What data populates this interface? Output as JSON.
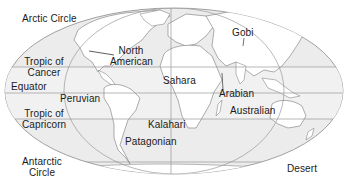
{
  "map": {
    "title": "World deserts map",
    "colors": {
      "ocean": "#ececec",
      "land": "#ffffff",
      "outline": "#8a8a8a",
      "grid": "#9a9a9a",
      "text": "#1a1a1a"
    },
    "latitude_labels": {
      "arctic_circle": "Arctic Circle",
      "tropic_cancer_1": "Tropic of",
      "tropic_cancer_2": "Cancer",
      "equator": "Equator",
      "tropic_capricorn_1": "Tropic of",
      "tropic_capricorn_2": "Capricorn",
      "antarctic_1": "Antarctic",
      "antarctic_2": "Circle"
    },
    "deserts": {
      "north_american_1": "North",
      "north_american_2": "American",
      "sahara": "Sahara",
      "gobi": "Gobi",
      "arabian": "Arabian",
      "australian": "Australian",
      "peruvian": "Peruvian",
      "kalahari": "Kalahari",
      "patagonian": "Patagonian",
      "desert_suffix": "Desert"
    }
  }
}
